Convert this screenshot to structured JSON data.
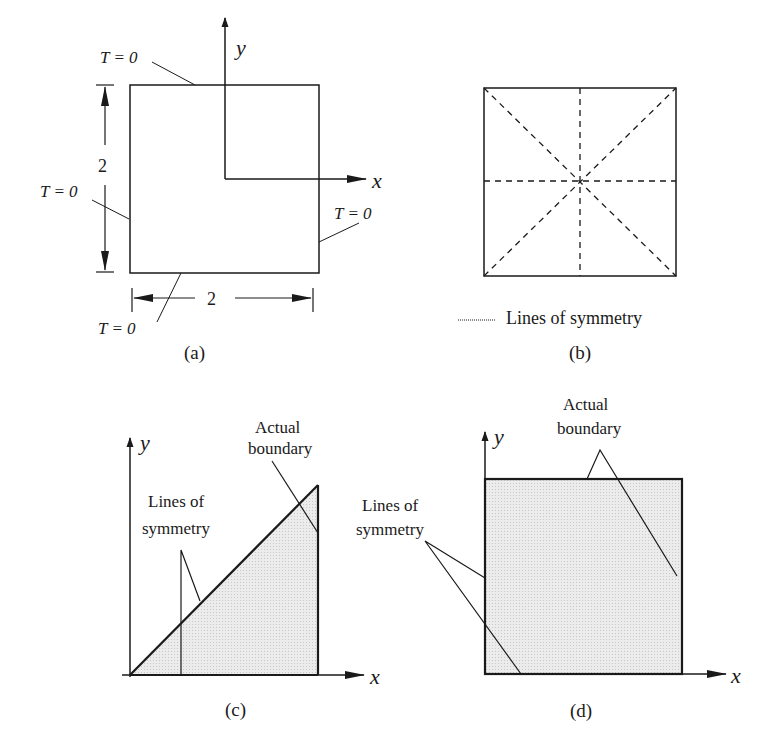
{
  "figure": {
    "panels": {
      "a": {
        "caption": "(a)",
        "axis_x": "x",
        "axis_y": "y",
        "boundary_top": "T = 0",
        "boundary_left": "T = 0",
        "boundary_right": "T = 0",
        "boundary_bottom": "T = 0",
        "height_dim": "2",
        "width_dim": "2"
      },
      "b": {
        "caption": "(b)",
        "legend_label": "Lines of symmetry"
      },
      "c": {
        "caption": "(c)",
        "axis_x": "x",
        "axis_y": "y",
        "actual_boundary_line1": "Actual",
        "actual_boundary_line2": "boundary",
        "symmetry_line1": "Lines of",
        "symmetry_line2": "symmetry"
      },
      "d": {
        "caption": "(d)",
        "axis_x": "x",
        "axis_y": "y",
        "actual_boundary_line1": "Actual",
        "actual_boundary_line2": "boundary",
        "symmetry_line1": "Lines of",
        "symmetry_line2": "symmetry"
      }
    },
    "colors": {
      "stroke": "#1a1a1a",
      "shade": "#e4e4e4"
    }
  }
}
